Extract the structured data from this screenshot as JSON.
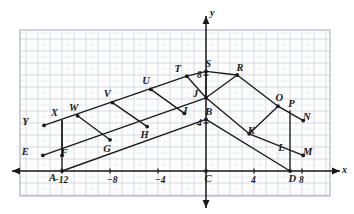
{
  "figure": {
    "type": "coordinate-plane-geometry-diagram",
    "axis_labels": {
      "x": "x",
      "y": "y"
    },
    "x_ticks": [
      {
        "text": "−12",
        "value": -12
      },
      {
        "text": "−8",
        "value": -8
      },
      {
        "text": "−4",
        "value": -4
      },
      {
        "text": "4",
        "value": 4
      },
      {
        "text": "8",
        "value": 8
      }
    ],
    "y_ticks": [
      {
        "text": "4",
        "value": 4
      },
      {
        "text": "8",
        "value": 8
      }
    ],
    "points": [
      {
        "label": "Y",
        "x": -13.5,
        "y": 3.8,
        "dot": true,
        "lx": -3.0,
        "ly": -0.55
      },
      {
        "label": "X",
        "x": -12.0,
        "y": 4.2,
        "dot": false,
        "lx": -1.3,
        "ly": -1.2
      },
      {
        "label": "W",
        "x": -10.7,
        "y": 4.6,
        "dot": true,
        "lx": -0.9,
        "ly": -1.3
      },
      {
        "label": "V",
        "x": -7.8,
        "y": 5.7,
        "dot": true,
        "lx": -0.9,
        "ly": -1.3
      },
      {
        "label": "U",
        "x": -4.6,
        "y": 6.8,
        "dot": true,
        "lx": -0.9,
        "ly": -1.3
      },
      {
        "label": "T",
        "x": -1.6,
        "y": 7.9,
        "dot": true,
        "lx": -1.5,
        "ly": -1.2
      },
      {
        "label": "S",
        "x": 0.0,
        "y": 8.3,
        "dot": true,
        "lx": 0.35,
        "ly": -1.2
      },
      {
        "label": "R",
        "x": 2.6,
        "y": 8.0,
        "dot": true,
        "lx": 0.35,
        "ly": -1.2
      },
      {
        "label": "O",
        "x": 6.0,
        "y": 5.4,
        "dot": true,
        "lx": 0.1,
        "ly": -1.3
      },
      {
        "label": "P",
        "x": 7.0,
        "y": 5.0,
        "dot": false,
        "lx": 0.2,
        "ly": -1.1
      },
      {
        "label": "N",
        "x": 8.1,
        "y": 4.2,
        "dot": true,
        "lx": 0.45,
        "ly": -0.5
      },
      {
        "label": "M",
        "x": 8.1,
        "y": 1.3,
        "dot": true,
        "lx": 0.45,
        "ly": -0.55
      },
      {
        "label": "L",
        "x": 7.0,
        "y": 1.6,
        "dot": false,
        "lx": -1.4,
        "ly": -0.55
      },
      {
        "label": "D",
        "x": 7.0,
        "y": 0.0,
        "dot": true,
        "lx": 0.25,
        "ly": 1.35
      },
      {
        "label": "K",
        "x": 3.6,
        "y": 3.1,
        "dot": true,
        "lx": 0.25,
        "ly": -0.5
      },
      {
        "label": "B",
        "x": 0.0,
        "y": 4.3,
        "dot": true,
        "lx": 0.35,
        "ly": -1.15
      },
      {
        "label": "C",
        "x": 0.0,
        "y": 0.0,
        "dot": true,
        "lx": 0.25,
        "ly": 1.35
      },
      {
        "label": "J",
        "x": 0.0,
        "y": 6.1,
        "dot": true,
        "lx": -1.6,
        "ly": -0.65
      },
      {
        "label": "I",
        "x": -1.8,
        "y": 4.8,
        "dot": true,
        "lx": 0.35,
        "ly": -0.4
      },
      {
        "label": "H",
        "x": -4.9,
        "y": 3.7,
        "dot": true,
        "lx": -0.6,
        "ly": 1.35
      },
      {
        "label": "G",
        "x": -8.0,
        "y": 2.6,
        "dot": true,
        "lx": -0.6,
        "ly": 1.45
      },
      {
        "label": "F",
        "x": -12.0,
        "y": 1.3,
        "dot": true,
        "lx": 0.3,
        "ly": -0.45
      },
      {
        "label": "E",
        "x": -13.6,
        "y": 1.3,
        "dot": true,
        "lx": -2.9,
        "ly": -0.5
      },
      {
        "label": "A",
        "x": -12.0,
        "y": 0.0,
        "dot": true,
        "lx": -1.6,
        "ly": 1.15
      }
    ],
    "segments": [
      {
        "name": "Y-to-T-upper-ray",
        "from": [
          -13.5,
          3.8
        ],
        "to": [
          -1.6,
          7.9
        ]
      },
      {
        "name": "T-to-S",
        "from": [
          -1.6,
          7.9
        ],
        "to": [
          0.0,
          8.3
        ]
      },
      {
        "name": "S-to-R",
        "from": [
          0.0,
          8.3
        ],
        "to": [
          2.6,
          8.0
        ]
      },
      {
        "name": "R-to-O",
        "from": [
          2.6,
          8.0
        ],
        "to": [
          6.0,
          5.4
        ]
      },
      {
        "name": "O-to-N",
        "from": [
          6.0,
          5.4
        ],
        "to": [
          8.1,
          4.2
        ]
      },
      {
        "name": "E-to-I-lower-ray",
        "from": [
          -13.6,
          1.3
        ],
        "to": [
          0.0,
          6.1
        ]
      },
      {
        "name": "J-to-K",
        "from": [
          0.0,
          6.1
        ],
        "to": [
          3.6,
          3.1
        ]
      },
      {
        "name": "K-to-M",
        "from": [
          3.6,
          3.1
        ],
        "to": [
          8.1,
          1.3
        ]
      },
      {
        "name": "A-to-B",
        "from": [
          -12.0,
          0.0
        ],
        "to": [
          0.0,
          4.3
        ]
      },
      {
        "name": "B-to-D",
        "from": [
          0.0,
          4.3
        ],
        "to": [
          7.0,
          0.0
        ]
      },
      {
        "name": "J-to-S",
        "from": [
          0.0,
          6.1
        ],
        "to": [
          0.0,
          8.3
        ]
      },
      {
        "name": "J-to-T",
        "from": [
          0.0,
          6.1
        ],
        "to": [
          -1.6,
          7.9
        ]
      },
      {
        "name": "J-to-R",
        "from": [
          0.0,
          6.1
        ],
        "to": [
          2.6,
          8.0
        ]
      },
      {
        "name": "rung-XF",
        "from": [
          -12.0,
          4.2
        ],
        "to": [
          -12.0,
          1.3
        ]
      },
      {
        "name": "rung-WG",
        "from": [
          -10.7,
          4.6
        ],
        "to": [
          -8.0,
          2.6
        ]
      },
      {
        "name": "rung-VH",
        "from": [
          -7.8,
          5.7
        ],
        "to": [
          -4.9,
          3.7
        ]
      },
      {
        "name": "rung-UI",
        "from": [
          -4.6,
          6.8
        ],
        "to": [
          -1.8,
          4.8
        ]
      },
      {
        "name": "rung-OK",
        "from": [
          6.0,
          5.4
        ],
        "to": [
          3.6,
          3.1
        ]
      },
      {
        "name": "rung-PL-D",
        "from": [
          7.0,
          5.0
        ],
        "to": [
          7.0,
          0.0
        ]
      },
      {
        "name": "AF-vertical",
        "from": [
          -12.0,
          4.2
        ],
        "to": [
          -12.0,
          0.0
        ]
      }
    ]
  }
}
